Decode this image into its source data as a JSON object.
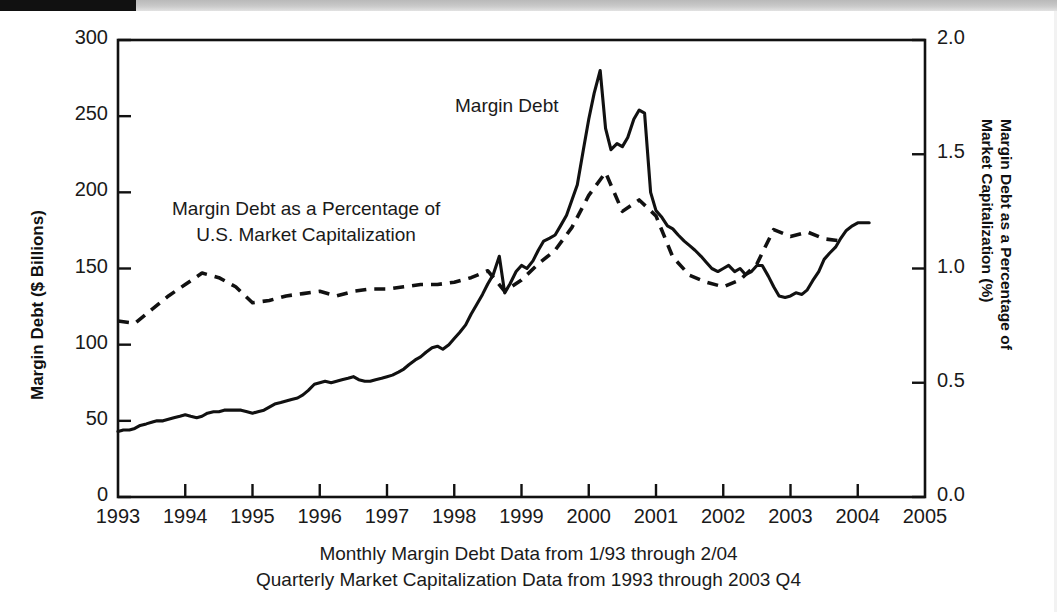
{
  "chart_data": {
    "type": "line",
    "title": "",
    "xlabel": "",
    "ylabel": "Margin Debt ($ Billions)",
    "y2label": "Margin Debt as a Percentage of Market Capitalization (%)",
    "xlim": [
      1993,
      2005
    ],
    "ylim": [
      0,
      300
    ],
    "y2lim": [
      0.0,
      2.0
    ],
    "grid": false,
    "legend_position": "inline-annotations",
    "x_ticks": [
      "1993",
      "1994",
      "1995",
      "1996",
      "1997",
      "1998",
      "1999",
      "2000",
      "2001",
      "2002",
      "2003",
      "2004",
      "2005"
    ],
    "y_ticks_left": [
      "0",
      "50",
      "100",
      "150",
      "200",
      "250",
      "300"
    ],
    "y_ticks_right": [
      "0.0",
      "0.5",
      "1.0",
      "1.5",
      "2.0"
    ],
    "annotations": [
      {
        "text": "Margin Debt",
        "x": 2000.0,
        "y": 265
      },
      {
        "text_line1": "Margin Debt as a Percentage of",
        "text_line2": "U.S. Market Capitalization",
        "x": 1995.4,
        "y": 205
      }
    ],
    "caption_line1": "Monthly Margin Debt Data from 1/93 through 2/04",
    "caption_line2": "Quarterly Market Capitalization Data from 1993 through 2003 Q4",
    "series": [
      {
        "name": "Margin Debt",
        "axis": "left",
        "style": "solid",
        "color": "#111111",
        "units": "$ Billions",
        "x": [
          1993.0,
          1993.08,
          1993.17,
          1993.25,
          1993.33,
          1993.42,
          1993.5,
          1993.58,
          1993.67,
          1993.75,
          1993.83,
          1993.92,
          1994.0,
          1994.08,
          1994.17,
          1994.25,
          1994.33,
          1994.42,
          1994.5,
          1994.58,
          1994.67,
          1994.75,
          1994.83,
          1994.92,
          1995.0,
          1995.08,
          1995.17,
          1995.25,
          1995.33,
          1995.42,
          1995.5,
          1995.58,
          1995.67,
          1995.75,
          1995.83,
          1995.92,
          1996.0,
          1996.08,
          1996.17,
          1996.25,
          1996.33,
          1996.42,
          1996.5,
          1996.58,
          1996.67,
          1996.75,
          1996.83,
          1996.92,
          1997.0,
          1997.08,
          1997.17,
          1997.25,
          1997.33,
          1997.42,
          1997.5,
          1997.58,
          1997.67,
          1997.75,
          1997.83,
          1997.92,
          1998.0,
          1998.08,
          1998.17,
          1998.25,
          1998.33,
          1998.42,
          1998.5,
          1998.58,
          1998.67,
          1998.75,
          1998.83,
          1998.92,
          1999.0,
          1999.08,
          1999.17,
          1999.25,
          1999.33,
          1999.42,
          1999.5,
          1999.58,
          1999.67,
          1999.75,
          1999.83,
          1999.92,
          2000.0,
          2000.08,
          2000.17,
          2000.25,
          2000.33,
          2000.42,
          2000.5,
          2000.58,
          2000.67,
          2000.75,
          2000.83,
          2000.92,
          2001.0,
          2001.08,
          2001.17,
          2001.25,
          2001.33,
          2001.42,
          2001.5,
          2001.58,
          2001.67,
          2001.75,
          2001.83,
          2001.92,
          2002.0,
          2002.08,
          2002.17,
          2002.25,
          2002.33,
          2002.42,
          2002.5,
          2002.58,
          2002.67,
          2002.75,
          2002.83,
          2002.92,
          2003.0,
          2003.08,
          2003.17,
          2003.25,
          2003.33,
          2003.42,
          2003.5,
          2003.58,
          2003.67,
          2003.75,
          2003.83,
          2003.92,
          2004.0,
          2004.08,
          2004.17
        ],
        "y": [
          43,
          44,
          44,
          45,
          47,
          48,
          49,
          50,
          50,
          51,
          52,
          53,
          54,
          53,
          52,
          53,
          55,
          56,
          56,
          57,
          57,
          57,
          57,
          56,
          55,
          56,
          57,
          59,
          61,
          62,
          63,
          64,
          65,
          67,
          70,
          74,
          75,
          76,
          75,
          76,
          77,
          78,
          79,
          77,
          76,
          76,
          77,
          78,
          79,
          80,
          82,
          84,
          87,
          90,
          92,
          95,
          98,
          99,
          97,
          100,
          104,
          108,
          113,
          120,
          126,
          133,
          140,
          146,
          158,
          134,
          140,
          148,
          152,
          150,
          155,
          162,
          168,
          170,
          172,
          178,
          185,
          195,
          205,
          228,
          248,
          265,
          280,
          242,
          228,
          232,
          230,
          236,
          248,
          254,
          252,
          200,
          188,
          184,
          178,
          176,
          172,
          168,
          165,
          162,
          158,
          154,
          150,
          148,
          150,
          152,
          148,
          150,
          146,
          148,
          152,
          152,
          145,
          138,
          132,
          131,
          132,
          134,
          133,
          136,
          142,
          148,
          156,
          160,
          164,
          170,
          175,
          178,
          180,
          180,
          180
        ]
      },
      {
        "name": "Margin Debt as a Percentage of U.S. Market Capitalization",
        "axis": "right",
        "style": "dashed",
        "color": "#111111",
        "units": "%",
        "x": [
          1993.0,
          1993.25,
          1993.5,
          1993.75,
          1994.0,
          1994.25,
          1994.5,
          1994.75,
          1995.0,
          1995.25,
          1995.5,
          1995.75,
          1996.0,
          1996.25,
          1996.5,
          1996.75,
          1997.0,
          1997.25,
          1997.5,
          1997.75,
          1998.0,
          1998.25,
          1998.5,
          1998.75,
          1999.0,
          1999.25,
          1999.5,
          1999.75,
          2000.0,
          2000.25,
          2000.5,
          2000.75,
          2001.0,
          2001.25,
          2001.5,
          2001.75,
          2002.0,
          2002.25,
          2002.5,
          2002.75,
          2003.0,
          2003.25,
          2003.5,
          2003.75
        ],
        "y": [
          0.77,
          0.76,
          0.82,
          0.88,
          0.93,
          0.98,
          0.96,
          0.92,
          0.85,
          0.86,
          0.88,
          0.89,
          0.9,
          0.88,
          0.9,
          0.91,
          0.91,
          0.92,
          0.93,
          0.93,
          0.94,
          0.96,
          0.99,
          0.9,
          0.95,
          1.02,
          1.08,
          1.18,
          1.32,
          1.42,
          1.25,
          1.3,
          1.23,
          1.05,
          0.97,
          0.94,
          0.92,
          0.95,
          1.02,
          1.17,
          1.14,
          1.16,
          1.13,
          1.12
        ]
      }
    ]
  },
  "figure": {
    "plot_left_px": 118,
    "plot_right_px": 925,
    "plot_top_px": 40,
    "plot_bottom_px": 497
  }
}
